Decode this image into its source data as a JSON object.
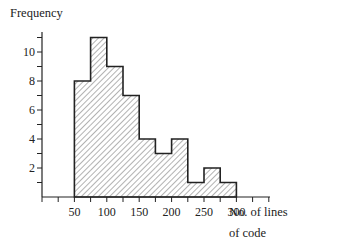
{
  "chart_data": {
    "type": "bar",
    "subtype": "histogram",
    "title": "",
    "ylabel": "Frequency",
    "xlabel": "No. of lines of code",
    "xlabel_lines": [
      "No. of lines",
      "of code"
    ],
    "bin_edges": [
      50,
      75,
      100,
      125,
      150,
      175,
      200,
      225,
      250,
      275,
      300
    ],
    "categories": [
      "50-75",
      "75-100",
      "100-125",
      "125-150",
      "150-175",
      "175-200",
      "200-225",
      "225-250",
      "250-275",
      "275-300"
    ],
    "values": [
      8,
      11,
      9,
      7,
      4,
      3,
      4,
      1,
      2,
      1
    ],
    "x_tick_labels": [
      "50",
      "100",
      "150",
      "200",
      "250",
      "300"
    ],
    "y_tick_labels": [
      "2",
      "4",
      "6",
      "8",
      "10"
    ],
    "xlim": [
      0,
      350
    ],
    "ylim": [
      0,
      12
    ],
    "grid": false,
    "legend": null,
    "fill": "diagonal hatching",
    "colors": {
      "line": "#222222",
      "hatch": "#555555",
      "background": "#ffffff"
    }
  }
}
